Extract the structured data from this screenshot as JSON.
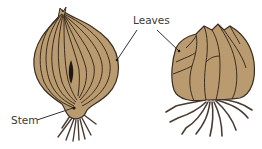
{
  "diagram": {
    "type": "labeled-illustration",
    "labels": {
      "leaves": "Leaves",
      "stem": "Stem"
    },
    "figures": [
      {
        "name": "onion-bulb-cross-section",
        "labels": [
          "Leaves",
          "Stem"
        ]
      },
      {
        "name": "garlic-bulb",
        "labels": [
          "Leaves"
        ]
      }
    ],
    "colors": {
      "bulb_fill": "#b99b6f",
      "outline": "#3b2d22",
      "root": "#4a3c32",
      "leader_line": "#333333",
      "text": "#3a3a3a"
    }
  }
}
